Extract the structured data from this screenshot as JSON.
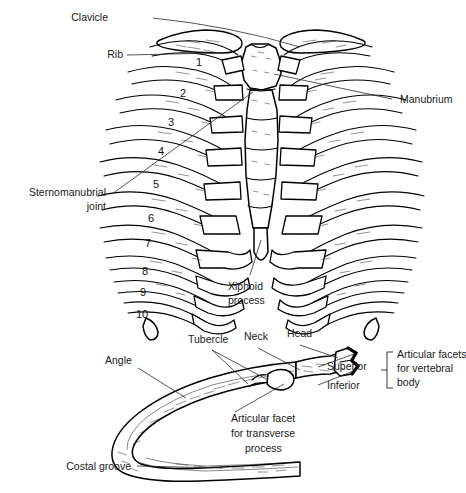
{
  "figure": {
    "style": "black line art on white"
  },
  "thorax_labels": {
    "clavicle": "Clavicle",
    "rib": "Rib",
    "manubrium": "Manubrium",
    "sternomanubrial_line1": "Sternomanubrial",
    "sternomanubrial_line2": "joint",
    "xiphoid_line1": "Xiphoid",
    "xiphoid_line2": "process"
  },
  "rib_numbers": [
    "1",
    "2",
    "3",
    "4",
    "5",
    "6",
    "7",
    "8",
    "9",
    "10"
  ],
  "rib_detail_labels": {
    "tubercle": "Tubercle",
    "neck": "Neck",
    "head": "Head",
    "angle": "Angle",
    "superior": "Superior",
    "inferior": "Inferior",
    "facets_line1": "Articular facets",
    "facets_line2": "for vertebral",
    "facets_line3": "body",
    "transverse_line1": "Articular facet",
    "transverse_line2": "for transverse",
    "transverse_line3": "process",
    "costal_groove": "Costal groove"
  },
  "colors": {
    "ink": "#000000",
    "leader": "#2b2b2b",
    "paper": "#ffffff"
  }
}
